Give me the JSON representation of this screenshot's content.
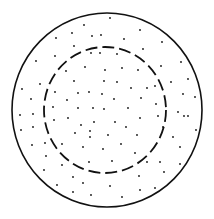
{
  "diagram": {
    "width": 214,
    "height": 219,
    "background": "#ffffff",
    "stroke_color": "#111111",
    "outer_circle": {
      "cx": 107,
      "cy": 110,
      "rx": 95,
      "ry": 97,
      "stroke_width": 1.6,
      "style": "solid"
    },
    "inner_circle": {
      "cx": 105,
      "cy": 110,
      "rx": 61,
      "ry": 63,
      "stroke_width": 1.8,
      "style": "dashed",
      "dasharray": "12 5"
    },
    "dot_radius": 0.9,
    "dots": [
      [
        110,
        18
      ],
      [
        84,
        25
      ],
      [
        72,
        33
      ],
      [
        92,
        36
      ],
      [
        101,
        35
      ],
      [
        140,
        30
      ],
      [
        56,
        38
      ],
      [
        124,
        39
      ],
      [
        162,
        42
      ],
      [
        74,
        46
      ],
      [
        143,
        49
      ],
      [
        36,
        61
      ],
      [
        55,
        56
      ],
      [
        91,
        53
      ],
      [
        100,
        53
      ],
      [
        117,
        54
      ],
      [
        181,
        62
      ],
      [
        66,
        71
      ],
      [
        85,
        67
      ],
      [
        105,
        70
      ],
      [
        122,
        68
      ],
      [
        138,
        70
      ],
      [
        161,
        66
      ],
      [
        40,
        84
      ],
      [
        74,
        81
      ],
      [
        104,
        81
      ],
      [
        117,
        82
      ],
      [
        131,
        88
      ],
      [
        171,
        82
      ],
      [
        188,
        79
      ],
      [
        22,
        89
      ],
      [
        55,
        92
      ],
      [
        78,
        93
      ],
      [
        89,
        92
      ],
      [
        102,
        94
      ],
      [
        147,
        88
      ],
      [
        155,
        86
      ],
      [
        183,
        94
      ],
      [
        31,
        99
      ],
      [
        67,
        100
      ],
      [
        114,
        99
      ],
      [
        141,
        98
      ],
      [
        195,
        97
      ],
      [
        53,
        107
      ],
      [
        78,
        108
      ],
      [
        93,
        108
      ],
      [
        104,
        109
      ],
      [
        128,
        108
      ],
      [
        156,
        104
      ],
      [
        178,
        112
      ],
      [
        188,
        116
      ],
      [
        20,
        115
      ],
      [
        33,
        114
      ],
      [
        68,
        118
      ],
      [
        94,
        122
      ],
      [
        115,
        122
      ],
      [
        140,
        118
      ],
      [
        158,
        116
      ],
      [
        54,
        120
      ],
      [
        81,
        125
      ],
      [
        126,
        127
      ],
      [
        163,
        127
      ],
      [
        184,
        116
      ],
      [
        21,
        130
      ],
      [
        33,
        127
      ],
      [
        75,
        133
      ],
      [
        90,
        131
      ],
      [
        108,
        135
      ],
      [
        137,
        135
      ],
      [
        196,
        130
      ],
      [
        32,
        145
      ],
      [
        45,
        143
      ],
      [
        62,
        144
      ],
      [
        90,
        137
      ],
      [
        121,
        144
      ],
      [
        173,
        137
      ],
      [
        46,
        156
      ],
      [
        83,
        147
      ],
      [
        103,
        149
      ],
      [
        135,
        153
      ],
      [
        180,
        147
      ],
      [
        44,
        170
      ],
      [
        62,
        165
      ],
      [
        89,
        162
      ],
      [
        112,
        161
      ],
      [
        147,
        162
      ],
      [
        160,
        162
      ],
      [
        180,
        164
      ],
      [
        57,
        185
      ],
      [
        73,
        177
      ],
      [
        83,
        183
      ],
      [
        110,
        186
      ],
      [
        139,
        176
      ],
      [
        164,
        172
      ],
      [
        73,
        192
      ],
      [
        91,
        195
      ],
      [
        122,
        197
      ],
      [
        140,
        190
      ],
      [
        155,
        188
      ]
    ]
  }
}
